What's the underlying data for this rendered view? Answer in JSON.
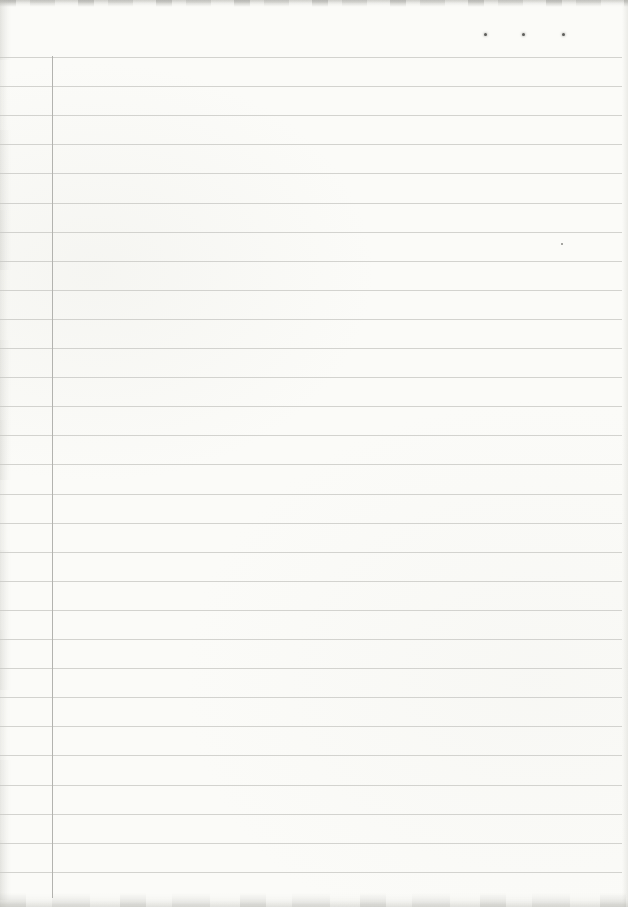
{
  "page": {
    "width": 628,
    "height": 907,
    "paper_color": "#fbfbf8",
    "content": ""
  },
  "ruling": {
    "line_count": 29,
    "first_line_y": 57,
    "line_spacing": 29.1,
    "line_left": 0,
    "line_right": 622,
    "line_color": "#c6c6c1",
    "margin_line": {
      "x": 52,
      "top": 56,
      "bottom": 898,
      "color": "#b3b3af"
    }
  },
  "marks": {
    "registration_dot_color": "#5e5e5b",
    "registration_dots": [
      {
        "x": 485,
        "y": 34
      },
      {
        "x": 523,
        "y": 34
      },
      {
        "x": 563,
        "y": 34
      }
    ],
    "speck_color": "#8a8a86",
    "specks": [
      {
        "x": 562,
        "y": 244
      }
    ]
  },
  "edges": {
    "top_shade": "#bdbdb7",
    "bottom_shade": "#cfcfc9",
    "left_shade": "#d6d6d0",
    "right_shade": "#d3d3cd"
  }
}
